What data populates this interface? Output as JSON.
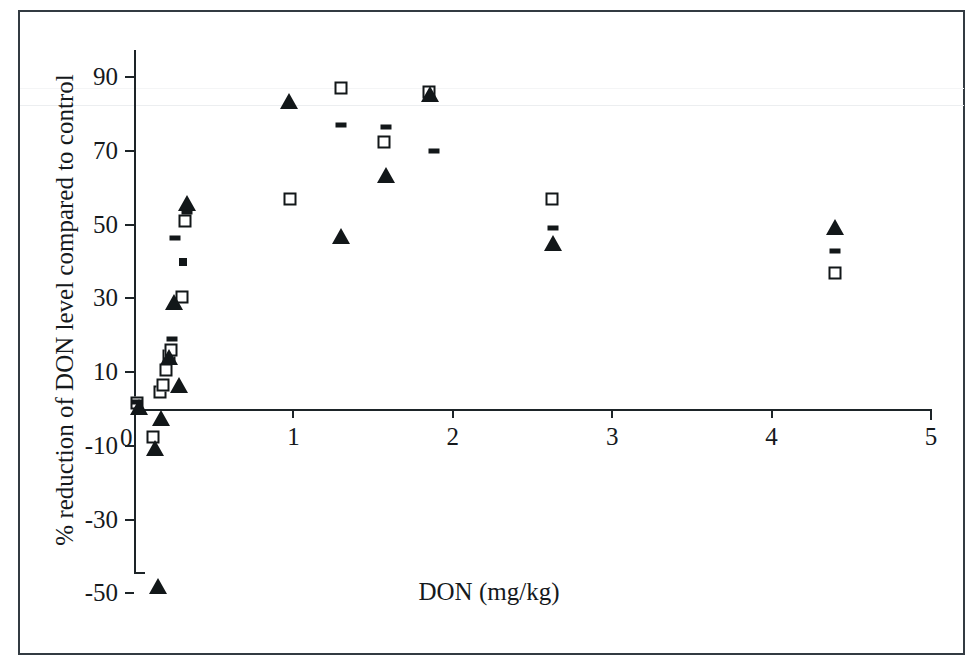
{
  "figure": {
    "background_color": "#ffffff",
    "frame_color": "#333b42",
    "axis_color": "#1d2428",
    "marker_color": "#121719"
  },
  "chart_data": {
    "type": "scatter",
    "title": "",
    "subtitle": "",
    "xlabel": "DON (mg/kg)",
    "ylabel": "% reduction of DON level compared to control",
    "xlim": [
      0,
      5
    ],
    "ylim": [
      -50,
      90
    ],
    "xticks": [
      0,
      1,
      2,
      3,
      4,
      5
    ],
    "xtick_labels": [
      "0",
      "1",
      "2",
      "3",
      "4",
      "5"
    ],
    "yticks": [
      -50,
      -30,
      -10,
      10,
      30,
      50,
      70,
      90
    ],
    "ytick_labels": [
      "-50",
      "-30",
      "-10",
      "10",
      "30",
      "50",
      "70",
      "90"
    ],
    "grid": false,
    "legend": "none",
    "legend_position": "none",
    "annotations": [],
    "series": [
      {
        "name": "open-square",
        "marker": "square",
        "points": [
          [
            0.02,
            1.5
          ],
          [
            0.12,
            -7.5
          ],
          [
            0.16,
            4.5
          ],
          [
            0.18,
            6.5
          ],
          [
            0.2,
            10.5
          ],
          [
            0.22,
            14.5
          ],
          [
            0.23,
            16.0
          ],
          [
            0.3,
            30.5
          ],
          [
            0.32,
            51.0
          ],
          [
            0.98,
            57.0
          ],
          [
            1.3,
            87.0
          ],
          [
            1.57,
            72.5
          ],
          [
            1.85,
            86.0
          ],
          [
            2.62,
            57.0
          ],
          [
            4.4,
            37.0
          ]
        ]
      },
      {
        "name": "filled-triangle",
        "marker": "triangle",
        "points": [
          [
            0.03,
            0.5
          ],
          [
            0.13,
            -10.5
          ],
          [
            0.15,
            -48.0
          ],
          [
            0.17,
            -2.5
          ],
          [
            0.22,
            14.0
          ],
          [
            0.25,
            29.0
          ],
          [
            0.28,
            6.5
          ],
          [
            0.33,
            56.0
          ],
          [
            0.97,
            83.5
          ],
          [
            1.3,
            47.0
          ],
          [
            1.58,
            63.5
          ],
          [
            1.86,
            85.5
          ],
          [
            2.63,
            45.0
          ],
          [
            4.4,
            49.5
          ]
        ]
      },
      {
        "name": "short-dash",
        "marker": "dash",
        "points": [
          [
            0.02,
            2.0
          ],
          [
            0.24,
            19.0
          ],
          [
            0.26,
            46.5
          ],
          [
            0.33,
            53.5
          ],
          [
            1.3,
            77.0
          ],
          [
            1.58,
            76.5
          ],
          [
            1.88,
            70.0
          ],
          [
            2.63,
            49.0
          ],
          [
            4.4,
            43.0
          ]
        ]
      },
      {
        "name": "small-filled-square",
        "marker": "dot",
        "points": [
          [
            0.31,
            40.0
          ]
        ]
      }
    ]
  }
}
